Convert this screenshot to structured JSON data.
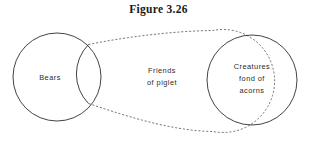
{
  "figure": {
    "caption": "Figure 3.26",
    "type": "venn-diagram"
  },
  "colors": {
    "background": "#ffffff",
    "solid_outline": "#2e2e2e",
    "dashed_outline": "#555555",
    "label_text": "#2b2b2b",
    "caption_text": "#1a1a1a"
  },
  "sets": {
    "bears": {
      "label": "Bears",
      "outline_style": "solid",
      "shape": "circle",
      "cx": 57,
      "cy": 77,
      "r": 44
    },
    "acorn_lovers": {
      "label_lines": [
        "Creatures",
        "fond of",
        "acorns"
      ],
      "label_line_1": "Creatures",
      "label_line_2": "fond of",
      "label_line_3": "acorns",
      "outline_style": "solid",
      "shape": "circle",
      "cx": 252,
      "cy": 80,
      "r": 45
    },
    "piglet_friends": {
      "label_lines": [
        "Friends",
        "of piglet"
      ],
      "label_line_1": "Friends",
      "label_line_2": "of piglet",
      "outline_style": "dashed",
      "shape": "convex-hull-envelope",
      "label_cx": 162,
      "label_cy": 78
    }
  },
  "relationships": {
    "bears_overlaps_piglet_friends": true,
    "acorn_lovers_inside_piglet_friends": true,
    "bears_overlaps_acorn_lovers": false
  }
}
